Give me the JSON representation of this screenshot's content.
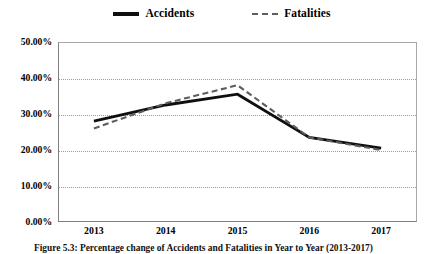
{
  "chart_data": {
    "type": "line",
    "title": "",
    "xlabel": "",
    "ylabel": "",
    "x": [
      "2013",
      "2014",
      "2015",
      "2016",
      "2017"
    ],
    "categories": [
      "2013",
      "2014",
      "2015",
      "2016",
      "2017"
    ],
    "series": [
      {
        "name": "Accidents",
        "style": "solid",
        "color": "#0f0f0f",
        "values": [
          28.0,
          32.5,
          35.5,
          23.5,
          20.5
        ]
      },
      {
        "name": "Fatalities",
        "style": "dashed",
        "color": "#5d5d5d",
        "values": [
          26.0,
          33.0,
          38.0,
          23.5,
          20.0
        ]
      }
    ],
    "ylim": [
      0,
      50
    ],
    "yticks": [
      0,
      10,
      20,
      30,
      40,
      50
    ],
    "ytick_labels": [
      "0.00%",
      "10.00%",
      "20.00%",
      "30.00%",
      "40.00%",
      "50.00%"
    ],
    "grid": true,
    "grid_axis": "y",
    "legend_position": "top-center"
  },
  "legend": {
    "entries": [
      {
        "label": "Accidents",
        "style": "solid"
      },
      {
        "label": "Fatalities",
        "style": "dashed"
      }
    ]
  },
  "caption": {
    "text": "Figure 5.3:  Percentage change of Accidents and Fatalities in Year to Year (2013-2017)"
  }
}
